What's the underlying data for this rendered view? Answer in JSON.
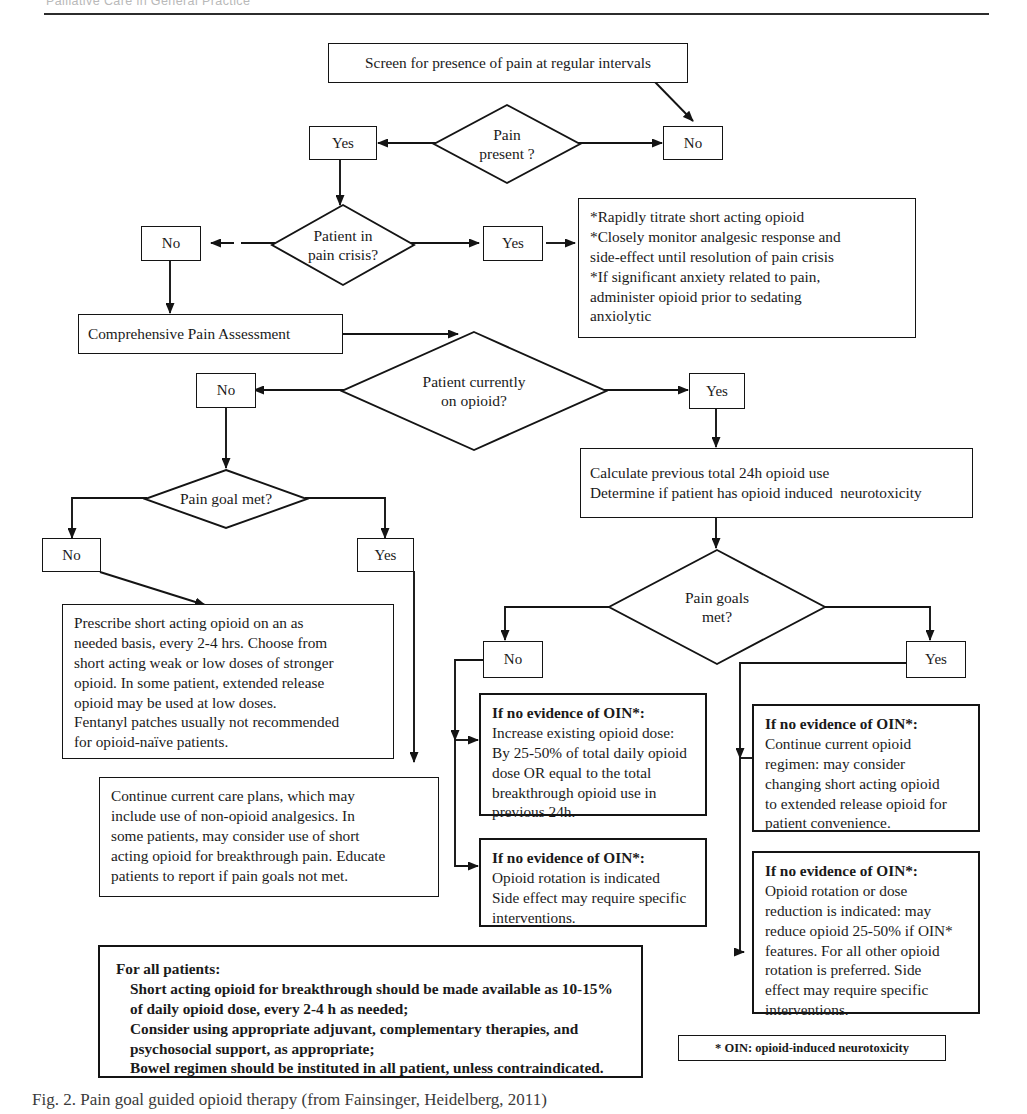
{
  "page": {
    "running_head": "Palliative Care in General Practice",
    "caption": "Fig. 2. Pain goal guided opioid therapy (from Fainsinger, Heidelberg, 2011)"
  },
  "legend": {
    "oin": "* OIN: opioid-induced neurotoxicity"
  },
  "labels": {
    "yes": "Yes",
    "no": "No"
  },
  "nodes": {
    "screen": "Screen for presence of pain at regular intervals",
    "pain_present": "Pain\npresent ?",
    "pain_present_yes": "Yes",
    "pain_present_no": "No",
    "pain_crisis": "Patient in\npain crisis?",
    "pain_crisis_no": "No",
    "pain_crisis_yes": "Yes",
    "crisis_actions": "*Rapidly titrate short acting opioid\n*Closely monitor analgesic response and\nside-effect until resolution of pain crisis\n*If significant anxiety related to pain,\nadminister opioid prior to sedating\nanxiolytic",
    "comprehensive": "Comprehensive Pain Assessment",
    "on_opioid": "Patient currently\non opioid?",
    "on_opioid_no": "No",
    "on_opioid_yes": "Yes",
    "calculate": "Calculate previous total 24h opioid use\nDetermine if patient has opioid induced  neurotoxicity",
    "pain_goal_met": "Pain goal met?",
    "pain_goal_no": "No",
    "pain_goal_yes": "Yes",
    "prescribe": "Prescribe short acting opioid on an as\nneeded basis, every 2-4 hrs. Choose from\nshort acting weak or low doses of stronger\nopioid. In some patient, extended release\nopioid may be used at low doses.\nFentanyl patches usually not recommended\nfor opioid-naïve patients.",
    "continue_care": "Continue current care plans, which may\ninclude use of non-opioid analgesics. In\nsome patients, may consider use of short\nacting opioid for breakthrough pain. Educate\npatients to report if pain goals not met.",
    "pain_goals_met": "Pain goals\nmet?",
    "pain_goals_no": "No",
    "pain_goals_yes": "Yes",
    "oin_heading": "If no evidence of OIN*:",
    "no_increase": "Increase existing opioid dose:\nBy 25-50% of total daily opioid\ndose OR equal to the total\nbreakthrough opioid use in\nprevious 24h.",
    "no_rotation": "Opioid rotation is indicated\nSide effect may require specific\ninterventions.",
    "yes_continue": "Continue current opioid\nregimen: may consider\nchanging short acting opioid\nto extended release opioid for\npatient convenience.",
    "yes_rotation": "Opioid rotation or dose\nreduction is indicated: may\nreduce opioid 25-50% if OIN*\nfeatures. For all other opioid\nrotation is preferred. Side\neffect may require specific\ninterventions.",
    "all_patients_heading": "For all patients:",
    "all_patients_body": "Short acting opioid for breakthrough should be made available as 10-15%\nof daily opioid dose, every 2-4 h as needed;\nConsider using appropriate adjuvant, complementary therapies, and\npsychosocial support, as appropriate;\nBowel regimen should be instituted in all patient, unless contraindicated."
  },
  "colors": {
    "ink": "#141414",
    "paper": "#ffffff",
    "runhead": "#b9b9b9"
  }
}
